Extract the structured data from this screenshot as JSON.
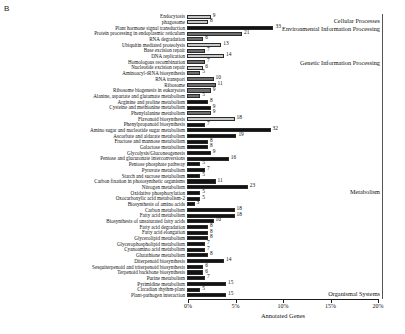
{
  "panel_letter": "B",
  "chart_data": {
    "type": "bar",
    "title": "",
    "xlabel": "Annotated Genes",
    "ylabel": "",
    "orientation": "horizontal",
    "xlim": [
      0,
      20
    ],
    "xtick_labels": [
      "0%",
      "5%",
      "10%",
      "15%",
      "20%"
    ],
    "xtick_values": [
      0,
      5,
      10,
      15,
      20
    ],
    "grid": false,
    "value_unit": "gene count",
    "categories": [
      "Endocytosis",
      "phagosome",
      "Plant hormone signal transduction",
      "Protein processing in endoplasmic reticulum",
      "RNA degradation",
      "Ubiquitin mediated proteolysis",
      "Base excision repair",
      "DNA replication",
      "Homologous recombination",
      "Nucleotide excision repair",
      "Aminoacyl-tRNA biosynthesis",
      "RNA transport",
      "Ribosome",
      "Ribosome biogenesis in eukaryotes",
      "Alanine, aspartate and glutamate metabolism",
      "Arginine and proline metabolism",
      "Cysteine and methionine metabolism",
      "Phenylalanine metabolism",
      "Flavonoid biosynthesis",
      "Phenylpropanoid biosynthesis",
      "Amino sugar and nucleotide sugar metabolism",
      "Ascorbate and aldarate metabolism",
      "Fructose and mannose metabolism",
      "Galactose metabolism",
      "Glycolysis/Gluconeogenesis",
      "Pentose and glucuronate interconversions",
      "Pentose phosphate pathway",
      "Pyruvate metabolism",
      "Starch and sucrose metabolism",
      "Carbon fixation in photosynthetic organisms",
      "Nitrogen metabolism",
      "Oxidative phosphorylation",
      "2-Oxocarboxylic acid metabolism",
      "Biosynthesis of amino acids",
      "Carbon metabolism",
      "Fatty acid metabolism",
      "Biosynthesis of unsaturated fatty acids",
      "Fatty acid degradation",
      "Fatty acid elongation",
      "Glycerolipid metabolism",
      "Glycerophospholipid metabolism",
      "Cyanoamino acid metabolism",
      "Glutathione metabolism",
      "Diterpenoid biosynthesis",
      "Sesquiterpenoid and triterpenoid biosynthesis",
      "Terpenoid backbone biosynthesis",
      "Purine metabolism",
      "Pyrimidine metabolism",
      "Circadian rhythm-plant",
      "Plant-pathogen interaction"
    ],
    "values": [
      9,
      8,
      33,
      21,
      6,
      13,
      7,
      14,
      7,
      6,
      5,
      10,
      11,
      9,
      5,
      8,
      9,
      9,
      18,
      7,
      32,
      19,
      8,
      8,
      9,
      16,
      5,
      7,
      5,
      11,
      23,
      5,
      5,
      3,
      18,
      18,
      10,
      8,
      8,
      8,
      7,
      7,
      8,
      14,
      6,
      6,
      7,
      15,
      5,
      15
    ],
    "percent_values": [
      2.5,
      2.2,
      9.1,
      5.8,
      1.7,
      3.6,
      1.9,
      3.9,
      1.9,
      1.7,
      1.4,
      2.8,
      3.0,
      2.5,
      1.4,
      2.2,
      2.5,
      2.5,
      5.0,
      1.9,
      8.8,
      5.2,
      2.2,
      2.2,
      2.5,
      4.4,
      1.4,
      1.9,
      1.4,
      3.0,
      6.4,
      1.4,
      1.4,
      0.8,
      5.0,
      5.0,
      2.8,
      2.2,
      2.2,
      2.2,
      1.9,
      1.9,
      2.2,
      3.9,
      1.7,
      1.7,
      1.9,
      4.1,
      1.4,
      4.1
    ],
    "bar_shades": [
      "light",
      "light",
      "dark",
      "mid",
      "mid",
      "light",
      "mid",
      "light",
      "mid",
      "light",
      "mid",
      "mid",
      "mid",
      "mid",
      "mid",
      "dark",
      "dark",
      "mid",
      "light",
      "dark",
      "dark",
      "dark",
      "dark",
      "dark",
      "dark",
      "dark",
      "dark",
      "dark",
      "dark",
      "dark",
      "dark",
      "dark",
      "dark",
      "dark",
      "dark",
      "dark",
      "dark",
      "dark",
      "dark",
      "dark",
      "dark",
      "dark",
      "dark",
      "dark",
      "dark",
      "dark",
      "dark",
      "dark",
      "dark",
      "dark"
    ],
    "groups": [
      {
        "label": "Cellular Processes",
        "start_index": 0,
        "end_index": 1
      },
      {
        "label": "Environmental Information Processing",
        "start_index": 2,
        "end_index": 2
      },
      {
        "label": "Genetic Information Processing",
        "start_index": 3,
        "end_index": 13
      },
      {
        "label": "Metabolism",
        "start_index": 14,
        "end_index": 47
      },
      {
        "label": "Organismal Systems",
        "start_index": 48,
        "end_index": 49
      }
    ]
  },
  "colors": {
    "bar_dark": "#121212",
    "bar_mid": "#6e6e6e",
    "bar_light": "#c8c8c8",
    "axis": "#1a1a1a",
    "text": "#111111"
  }
}
